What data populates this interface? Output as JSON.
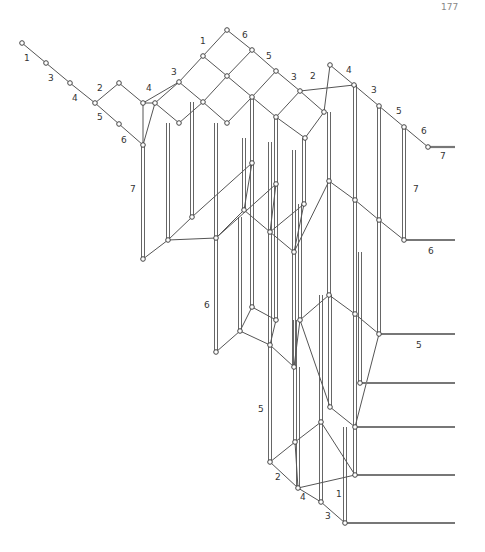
{
  "page_number": "177",
  "colors": {
    "edge": "#555555",
    "node_stroke": "#444444",
    "bar": "#777777",
    "label": "#333333"
  },
  "nodes": [
    [
      22,
      43
    ],
    [
      46,
      63
    ],
    [
      70,
      83
    ],
    [
      95,
      103
    ],
    [
      119,
      83
    ],
    [
      119,
      124
    ],
    [
      143,
      103
    ],
    [
      143,
      145
    ],
    [
      227,
      30
    ],
    [
      203,
      56
    ],
    [
      252,
      50
    ],
    [
      179,
      82
    ],
    [
      227,
      76
    ],
    [
      276,
      71
    ],
    [
      155,
      103
    ],
    [
      203,
      102
    ],
    [
      252,
      97
    ],
    [
      300,
      91
    ],
    [
      179,
      123
    ],
    [
      227,
      123
    ],
    [
      276,
      117
    ],
    [
      324,
      112
    ],
    [
      305,
      138
    ],
    [
      330,
      65
    ],
    [
      354,
      85
    ],
    [
      379,
      106
    ],
    [
      404,
      127
    ],
    [
      428,
      147
    ],
    [
      143,
      259
    ],
    [
      168,
      240
    ],
    [
      192,
      217
    ],
    [
      216,
      238
    ],
    [
      252,
      163
    ],
    [
      276,
      184
    ],
    [
      244,
      210
    ],
    [
      270,
      232
    ],
    [
      294,
      252
    ],
    [
      329,
      181
    ],
    [
      355,
      200
    ],
    [
      379,
      220
    ],
    [
      304,
      204
    ],
    [
      404,
      240
    ],
    [
      216,
      352
    ],
    [
      240,
      331
    ],
    [
      270,
      345
    ],
    [
      252,
      307
    ],
    [
      276,
      320
    ],
    [
      294,
      367
    ],
    [
      300,
      320
    ],
    [
      329,
      295
    ],
    [
      355,
      314
    ],
    [
      379,
      334
    ],
    [
      330,
      407
    ],
    [
      355,
      427
    ],
    [
      360,
      383
    ],
    [
      270,
      462
    ],
    [
      295,
      442
    ],
    [
      321,
      422
    ],
    [
      298,
      488
    ],
    [
      321,
      502
    ],
    [
      345,
      523
    ],
    [
      355,
      475
    ]
  ],
  "edges": [
    [
      0,
      1
    ],
    [
      1,
      2
    ],
    [
      2,
      3
    ],
    [
      3,
      4
    ],
    [
      3,
      5
    ],
    [
      4,
      6
    ],
    [
      5,
      7
    ],
    [
      6,
      7
    ],
    [
      8,
      9
    ],
    [
      8,
      10
    ],
    [
      9,
      11
    ],
    [
      9,
      12
    ],
    [
      10,
      12
    ],
    [
      10,
      13
    ],
    [
      11,
      14
    ],
    [
      11,
      15
    ],
    [
      12,
      15
    ],
    [
      12,
      16
    ],
    [
      13,
      16
    ],
    [
      13,
      17
    ],
    [
      14,
      7
    ],
    [
      15,
      18
    ],
    [
      16,
      19
    ],
    [
      17,
      20
    ],
    [
      17,
      21
    ],
    [
      6,
      11
    ],
    [
      6,
      14
    ],
    [
      18,
      14
    ],
    [
      19,
      15
    ],
    [
      20,
      16
    ],
    [
      20,
      22
    ],
    [
      21,
      22
    ],
    [
      21,
      23
    ],
    [
      23,
      24
    ],
    [
      24,
      25
    ],
    [
      25,
      26
    ],
    [
      26,
      27
    ],
    [
      17,
      24
    ],
    [
      28,
      29
    ],
    [
      29,
      30
    ],
    [
      30,
      32
    ],
    [
      29,
      31
    ],
    [
      31,
      33
    ],
    [
      34,
      31
    ],
    [
      34,
      35
    ],
    [
      35,
      36
    ],
    [
      36,
      37
    ],
    [
      37,
      38
    ],
    [
      38,
      39
    ],
    [
      39,
      41
    ],
    [
      40,
      35
    ],
    [
      40,
      36
    ],
    [
      33,
      35
    ],
    [
      32,
      34
    ],
    [
      42,
      43
    ],
    [
      43,
      45
    ],
    [
      43,
      44
    ],
    [
      44,
      46
    ],
    [
      45,
      46
    ],
    [
      44,
      47
    ],
    [
      47,
      48
    ],
    [
      48,
      49
    ],
    [
      49,
      50
    ],
    [
      50,
      51
    ],
    [
      48,
      52
    ],
    [
      52,
      53
    ],
    [
      51,
      53
    ],
    [
      55,
      56
    ],
    [
      56,
      57
    ],
    [
      55,
      58
    ],
    [
      58,
      59
    ],
    [
      59,
      60
    ],
    [
      56,
      58
    ],
    [
      57,
      61
    ],
    [
      58,
      61
    ]
  ],
  "verticals": [
    [
      143,
      145,
      143,
      259
    ],
    [
      168,
      123,
      168,
      240
    ],
    [
      192,
      102,
      192,
      217
    ],
    [
      216,
      123,
      216,
      238
    ],
    [
      252,
      97,
      252,
      163
    ],
    [
      276,
      117,
      276,
      184
    ],
    [
      244,
      138,
      244,
      210
    ],
    [
      270,
      142,
      270,
      232
    ],
    [
      294,
      150,
      294,
      252
    ],
    [
      329,
      112,
      329,
      181
    ],
    [
      355,
      85,
      355,
      200
    ],
    [
      379,
      106,
      379,
      220
    ],
    [
      304,
      138,
      304,
      204
    ],
    [
      404,
      127,
      404,
      240
    ],
    [
      216,
      238,
      216,
      352
    ],
    [
      240,
      217,
      240,
      331
    ],
    [
      270,
      232,
      270,
      345
    ],
    [
      252,
      163,
      252,
      307
    ],
    [
      276,
      184,
      276,
      320
    ],
    [
      294,
      252,
      294,
      367
    ],
    [
      300,
      204,
      300,
      320
    ],
    [
      329,
      181,
      329,
      295
    ],
    [
      355,
      200,
      355,
      314
    ],
    [
      379,
      220,
      379,
      334
    ],
    [
      330,
      295,
      330,
      407
    ],
    [
      355,
      314,
      355,
      427
    ],
    [
      360,
      252,
      360,
      383
    ],
    [
      270,
      345,
      270,
      462
    ],
    [
      295,
      320,
      295,
      442
    ],
    [
      321,
      295,
      321,
      422
    ],
    [
      298,
      367,
      298,
      488
    ],
    [
      321,
      407,
      321,
      502
    ],
    [
      345,
      427,
      345,
      523
    ],
    [
      355,
      383,
      355,
      475
    ]
  ],
  "bars": [
    [
      428,
      147,
      455,
      147
    ],
    [
      404,
      240,
      455,
      240
    ],
    [
      379,
      334,
      455,
      334
    ],
    [
      360,
      383,
      455,
      383
    ],
    [
      355,
      427,
      455,
      427
    ],
    [
      355,
      475,
      455,
      475
    ],
    [
      345,
      523,
      455,
      523
    ]
  ],
  "labels": [
    {
      "x": 24,
      "y": 61,
      "text": "1"
    },
    {
      "x": 48,
      "y": 81,
      "text": "3"
    },
    {
      "x": 72,
      "y": 101,
      "text": "4"
    },
    {
      "x": 97,
      "y": 120,
      "text": "5"
    },
    {
      "x": 97,
      "y": 91,
      "text": "2"
    },
    {
      "x": 146,
      "y": 91,
      "text": "4"
    },
    {
      "x": 121,
      "y": 143,
      "text": "6"
    },
    {
      "x": 171,
      "y": 75,
      "text": "3"
    },
    {
      "x": 200,
      "y": 44,
      "text": "1"
    },
    {
      "x": 242,
      "y": 38,
      "text": "6"
    },
    {
      "x": 266,
      "y": 59,
      "text": "5"
    },
    {
      "x": 291,
      "y": 80,
      "text": "3"
    },
    {
      "x": 310,
      "y": 79,
      "text": "2"
    },
    {
      "x": 346,
      "y": 73,
      "text": "4"
    },
    {
      "x": 371,
      "y": 93,
      "text": "3"
    },
    {
      "x": 396,
      "y": 114,
      "text": "5"
    },
    {
      "x": 421,
      "y": 134,
      "text": "6"
    },
    {
      "x": 440,
      "y": 159,
      "text": "7"
    },
    {
      "x": 130,
      "y": 192,
      "text": "7"
    },
    {
      "x": 413,
      "y": 192,
      "text": "7"
    },
    {
      "x": 428,
      "y": 254,
      "text": "6"
    },
    {
      "x": 204,
      "y": 308,
      "text": "6"
    },
    {
      "x": 416,
      "y": 348,
      "text": "5"
    },
    {
      "x": 258,
      "y": 412,
      "text": "5"
    },
    {
      "x": 275,
      "y": 480,
      "text": "2"
    },
    {
      "x": 300,
      "y": 500,
      "text": "4"
    },
    {
      "x": 336,
      "y": 497,
      "text": "1"
    },
    {
      "x": 325,
      "y": 519,
      "text": "3"
    }
  ]
}
